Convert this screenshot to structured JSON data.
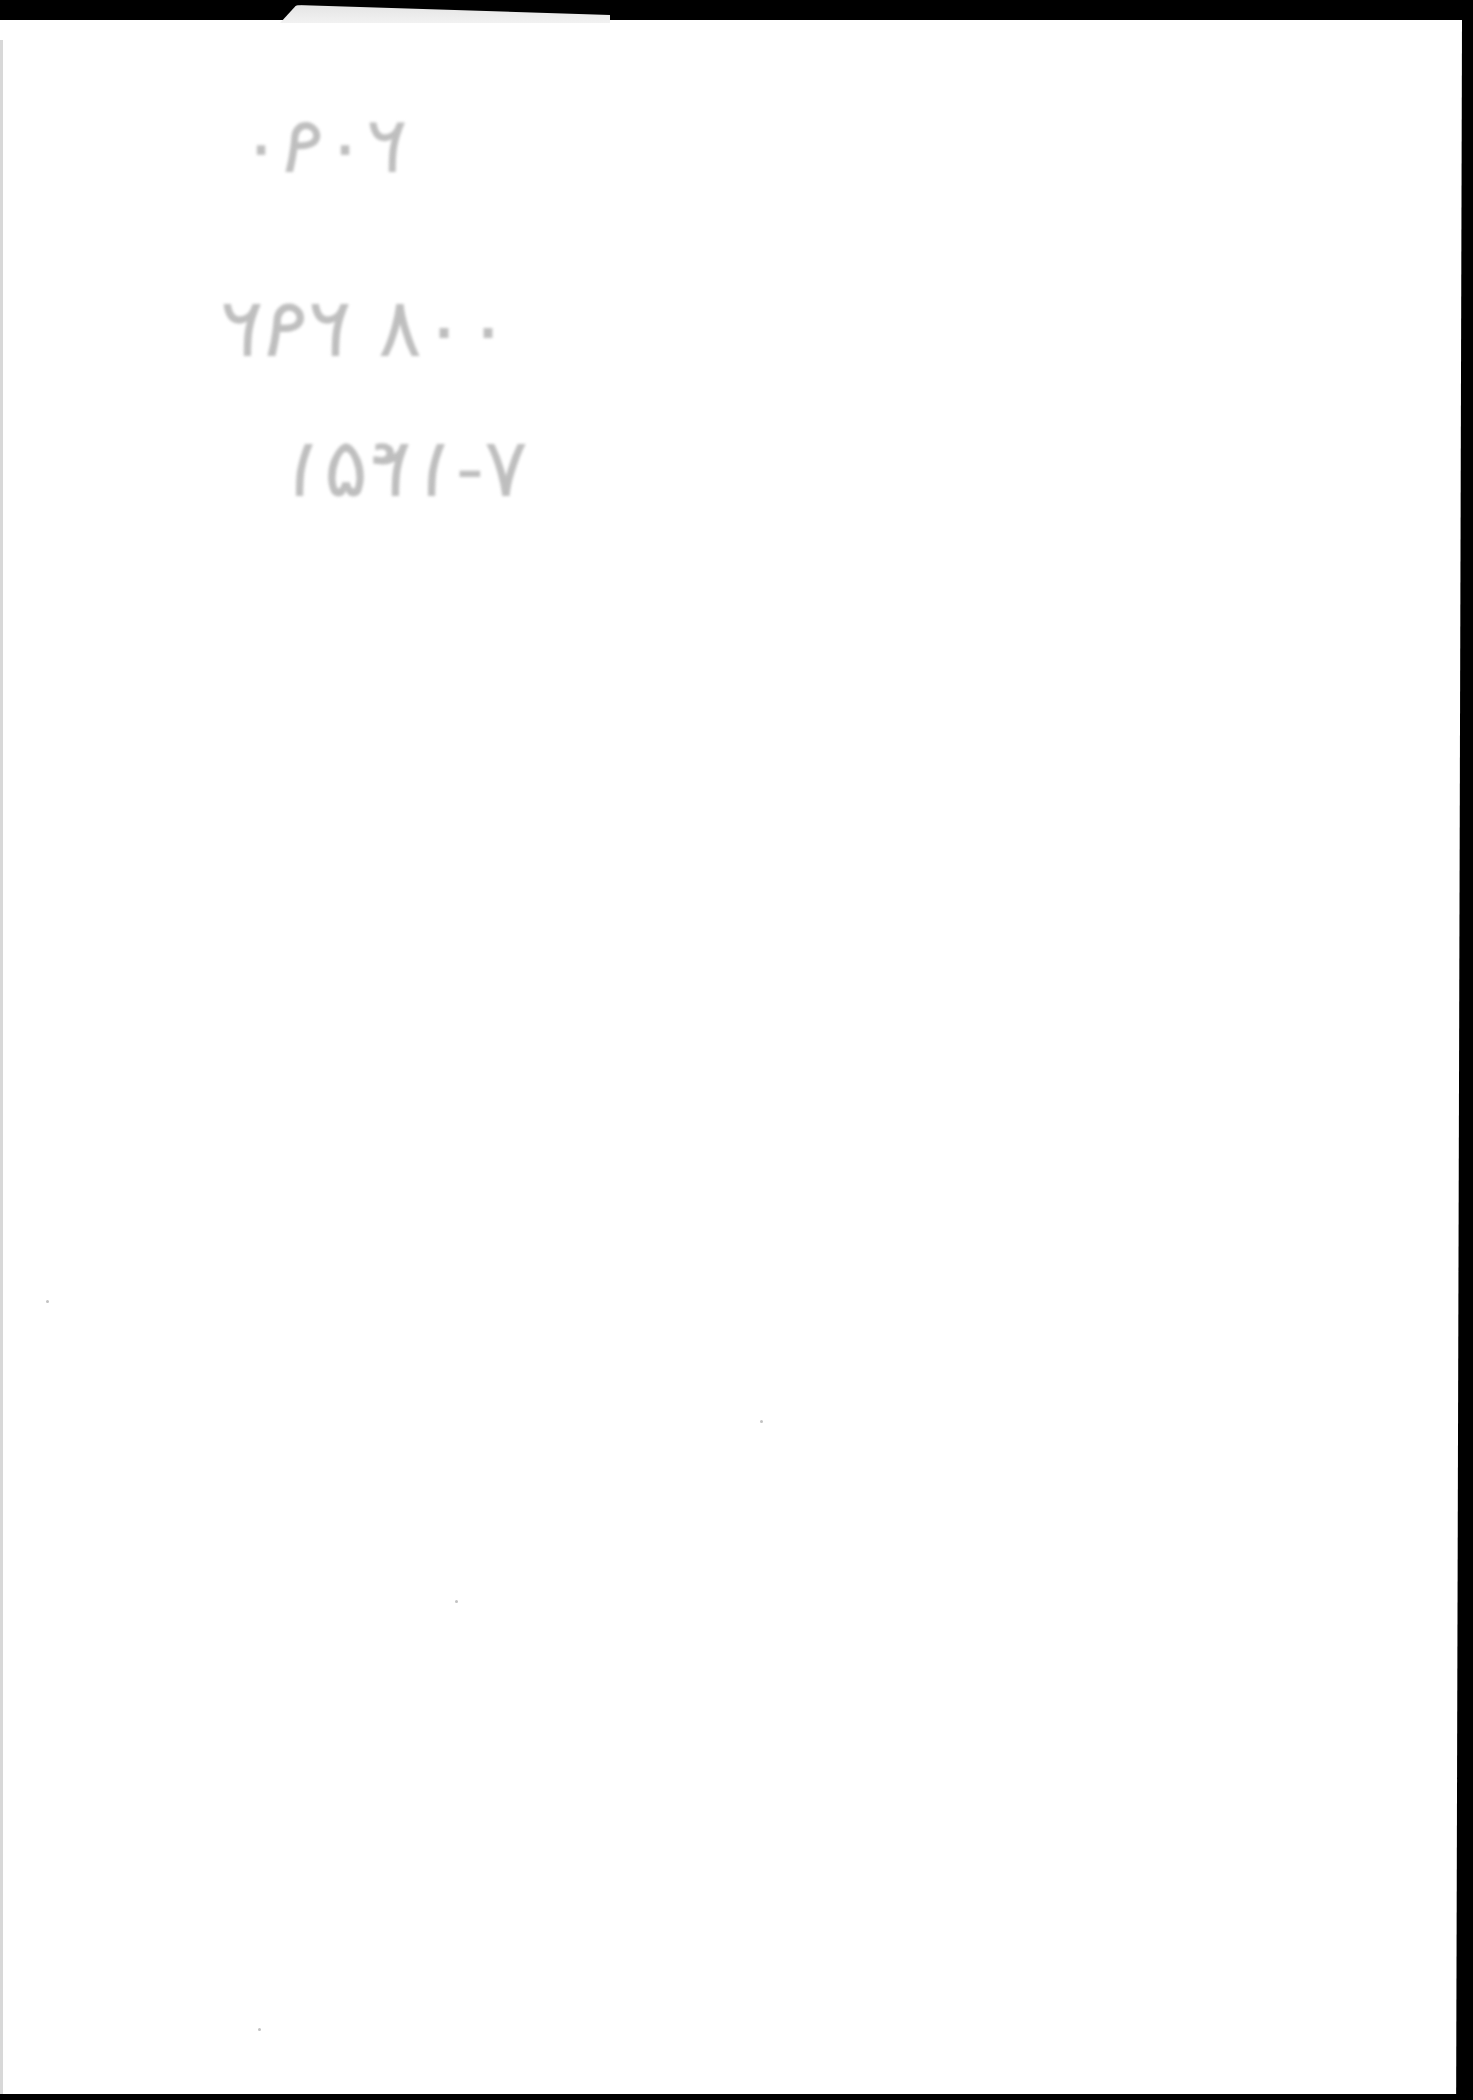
{
  "document": {
    "type": "scanned blank page",
    "background_color": "#ffffff",
    "border_color": "#000000",
    "handwriting": {
      "description": "faint mirrored handwritten bleed-through, illegible",
      "color": "#8a8a8a",
      "lines": [
        {
          "text": "۲۰۹۰"
        },
        {
          "text": "۲۹۲ ۰۰۸"
        },
        {
          "text": "۷-۱۴۵۱"
        }
      ]
    }
  }
}
